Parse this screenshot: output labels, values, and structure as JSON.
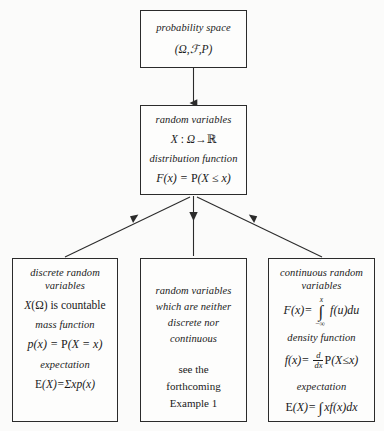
{
  "diagram": {
    "background_color": "#fbfbfa",
    "line_color": "#2b2b2b",
    "nodes": {
      "probability_space": {
        "name": "probability space",
        "lines": [
          "probability space",
          "(Ω, ℱ, P)"
        ]
      },
      "random_variables": {
        "name": "random variables",
        "lines": [
          "random variables",
          "X : Ω→ℝ",
          "distribution function",
          "F(x) = P(X ≤ x)"
        ]
      },
      "discrete": {
        "name": "discrete random variables",
        "heading": "discrete random variables",
        "lines": [
          "X(Ω) is countable",
          "mass function",
          "p(x) = P(X = x)",
          "expectation",
          "E(X)=Σxp(x)"
        ]
      },
      "neither": {
        "name": "neither discrete nor continuous",
        "heading": "random variables which are neither discrete nor continuous",
        "lines": [
          "see the",
          "forthcoming",
          "Example 1"
        ]
      },
      "continuous": {
        "name": "continuous random variables",
        "heading": "continuous random variables",
        "lines": [
          "F(x) = ∫₋∞ˣ f(u)du",
          "density function",
          "f(x) = d/dx P(X≤x)",
          "expectation",
          "E(X)=∫ xf(x)dx"
        ]
      }
    },
    "text": {
      "probability_space_label": "probability space",
      "probability_space_triple": "(Ω,ℱ,P)",
      "random_variables_label": "random variables",
      "rv_map_X": "X",
      "rv_map_colon": " : ",
      "rv_map_omega": "Ω",
      "rv_map_arrow": "→",
      "rv_map_reals": "ℝ",
      "distribution_function_label": "distribution function",
      "distribution_F": "F",
      "distribution_xeq": "(x) = ",
      "distribution_P": "P",
      "distribution_rhs": "(X ≤ x)",
      "discrete_head_1": "discrete random",
      "discrete_head_2": "variables",
      "discrete_countable_X": "X",
      "discrete_countable_rest": "(Ω) is countable",
      "mass_function_label": "mass function",
      "mass_p": "p",
      "mass_mid": "(x) = ",
      "mass_P": "P",
      "mass_rhs": "(X = x)",
      "expectation_label": "expectation",
      "discrete_exp_E": "E",
      "discrete_exp_rest": "(X)=Σxp(x)",
      "neither_1": "random variables",
      "neither_2": "which are neither",
      "neither_3": "discrete nor",
      "neither_4": "continuous",
      "neither_see": "see the",
      "neither_forthcoming": "forthcoming",
      "neither_example": "Example 1",
      "continuous_head_1": "continuous random",
      "continuous_head_2": "variables",
      "cont_F": "F",
      "cont_F_mid": "(x)= ",
      "cont_int_top": "x",
      "cont_int_bot": "−∞",
      "cont_int_body": "f(u)du",
      "density_function_label": "density function",
      "cont_f": "f",
      "cont_f_mid": "(x)= ",
      "cont_frac_num": "d",
      "cont_frac_den": "dx",
      "cont_P": "P",
      "cont_P_rhs": "(X≤x)",
      "continuous_expectation_label": "expectation",
      "cont_exp_E": "E",
      "cont_exp_mid": "(X)=",
      "cont_exp_rest": "xf(x)dx"
    },
    "connectors": [
      {
        "name": "probability-space-to-random-variables",
        "direction": "down"
      },
      {
        "name": "discrete-to-random-variables",
        "direction": "up-right"
      },
      {
        "name": "neither-to-random-variables",
        "direction": "down"
      },
      {
        "name": "continuous-to-random-variables",
        "direction": "up-left"
      }
    ]
  }
}
